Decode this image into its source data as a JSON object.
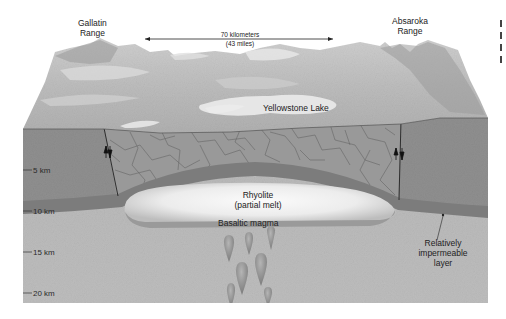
{
  "diagram": {
    "surface_labels": {
      "left_range": "Gallatin\nRange",
      "left_range_line1": "Gallatin",
      "left_range_line2": "Range",
      "right_range_line1": "Absaroka",
      "right_range_line2": "Range",
      "lake": "Yellowstone Lake"
    },
    "scale_bar": {
      "line1": "70 kilometers",
      "line2": "(43 miles)"
    },
    "subsurface_labels": {
      "rhyolite_line1": "Rhyolite",
      "rhyolite_line2": "(partial melt)",
      "basaltic": "Basaltic magma",
      "layer_line1": "Relatively",
      "layer_line2": "impermeable",
      "layer_line3": "layer"
    },
    "depth_ticks": [
      {
        "label": "5 km"
      },
      {
        "label": "10 km"
      },
      {
        "label": "15 km"
      },
      {
        "label": "20 km"
      }
    ],
    "colors": {
      "background": "#ffffff",
      "landscape_light": "#d8d8d8",
      "landscape_mid": "#b9b9b9",
      "upper_crust": "#8c8c8c",
      "fractured_zone": "#959595",
      "lower_crust": "#b3b3b3",
      "impermeable_layer": "#7e7e7e",
      "rhyolite": "#f0f0f0",
      "basalt_drop": "#8a8a8a"
    }
  }
}
